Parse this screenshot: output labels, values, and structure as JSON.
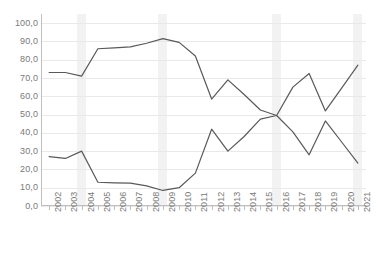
{
  "chart_data": {
    "type": "line",
    "title": "",
    "subtitle": "",
    "xlabel": "",
    "ylabel": "",
    "grid": true,
    "legend": "none",
    "ylim": [
      0,
      105
    ],
    "xlim_categories_count": 20,
    "y_ticks": [
      "0,0",
      "10,0",
      "20,0",
      "30,0",
      "40,0",
      "50,0",
      "60,0",
      "70,0",
      "80,0",
      "90,0",
      "100,0"
    ],
    "y_tick_values": [
      0,
      10,
      20,
      30,
      40,
      50,
      60,
      70,
      80,
      90,
      100
    ],
    "categories": [
      "2002",
      "2003",
      "2004",
      "2005",
      "2006",
      "2007",
      "2008",
      "2009",
      "2010",
      "2011",
      "2012",
      "2013",
      "2014",
      "2015",
      "2016",
      "2017",
      "2018",
      "2019",
      "2020",
      "2021"
    ],
    "series": [
      {
        "name": "Series 1",
        "color": "#595959",
        "values": [
          73.0,
          73.0,
          71.0,
          86.0,
          86.5,
          87.0,
          89.0,
          91.5,
          89.5,
          82.0,
          58.5,
          69.0,
          61.0,
          52.5,
          49.5,
          40.5,
          28.0,
          46.5,
          35.0,
          23.5
        ]
      },
      {
        "name": "Series 2",
        "color": "#595959",
        "values": [
          27.0,
          26.0,
          30.0,
          13.0,
          12.7,
          12.5,
          11.0,
          8.5,
          10.0,
          18.0,
          42.0,
          30.0,
          38.0,
          47.5,
          49.5,
          65.0,
          72.5,
          52.0,
          64.5,
          77.0
        ]
      }
    ],
    "highlight_bands": [
      {
        "label": "2004",
        "category_index": 2
      },
      {
        "label": "2009",
        "category_index": 7
      },
      {
        "label": "2016",
        "category_index": 14
      },
      {
        "label": "2021",
        "category_index": 19
      }
    ],
    "colors": {
      "background": "#ffffff",
      "gridline": "#e9e9e9",
      "axis": "#bfbfbf",
      "tick_text": "#7a7a7a",
      "band": "#f2f2f2",
      "line": "#595959"
    }
  }
}
